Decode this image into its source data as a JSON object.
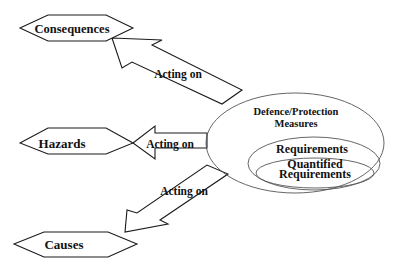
{
  "diagram": {
    "nodes": {
      "consequences": {
        "label": "Consequences"
      },
      "hazards": {
        "label": "Hazards"
      },
      "causes": {
        "label": "Causes"
      }
    },
    "arrows": [
      {
        "id": "to-consequences",
        "label": "Acting on"
      },
      {
        "id": "to-hazards",
        "label": "Acting on"
      },
      {
        "id": "to-causes",
        "label": "Acting on"
      }
    ],
    "measures": {
      "outer_line1": "Defence/Protection",
      "outer_line2": "Measures",
      "middle": "Requirements",
      "inner_line1": "Quantified",
      "inner_line2": "Requirements"
    }
  }
}
